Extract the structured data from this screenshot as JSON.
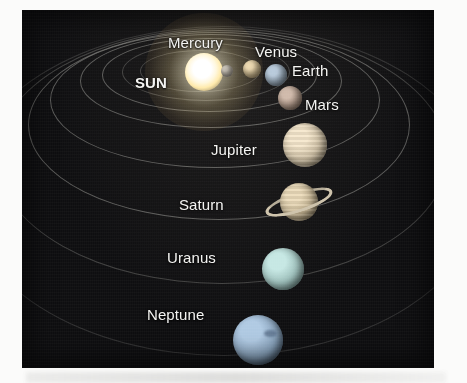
{
  "figure": {
    "type": "solar-system-diagram",
    "background_color": "#0e0e10",
    "label_color": "#f4f4f2",
    "orbit_color": "#c4c4bc",
    "panel": {
      "x": 22,
      "y": 10,
      "width": 412,
      "height": 358
    }
  },
  "star": {
    "name": "SUN",
    "label": "SUN",
    "color": "#fff7dd",
    "glow_color": "#ffe296",
    "cx": 182,
    "cy": 62,
    "radius": 19,
    "label_x": 113,
    "label_y": 64,
    "font_size": 15
  },
  "planets": [
    {
      "name": "Mercury",
      "label": "Mercury",
      "color": "#b9b2a6",
      "cx": 205,
      "cy": 61,
      "radius": 6,
      "label_x": 146,
      "label_y": 24,
      "font_size": 15,
      "order": 1
    },
    {
      "name": "Venus",
      "label": "Venus",
      "color": "#c9b489",
      "cx": 230,
      "cy": 59,
      "radius": 9,
      "label_x": 233,
      "label_y": 33,
      "font_size": 15,
      "order": 2
    },
    {
      "name": "Earth",
      "label": "Earth",
      "color": "#8fa2b4",
      "cx": 254,
      "cy": 65,
      "radius": 11,
      "label_x": 270,
      "label_y": 52,
      "font_size": 15,
      "order": 3
    },
    {
      "name": "Mars",
      "label": "Mars",
      "color": "#a89182",
      "cx": 268,
      "cy": 88,
      "radius": 12,
      "label_x": 283,
      "label_y": 86,
      "font_size": 15,
      "order": 4
    },
    {
      "name": "Jupiter",
      "label": "Jupiter",
      "color": "#cfc0a4",
      "cx": 283,
      "cy": 135,
      "radius": 22,
      "label_x": 189,
      "label_y": 131,
      "font_size": 15,
      "order": 5
    },
    {
      "name": "Saturn",
      "label": "Saturn",
      "color": "#c5b492",
      "ring_color": "#cfc4ac",
      "cx": 277,
      "cy": 192,
      "radius": 19,
      "ring_rx": 35,
      "ring_ry": 10,
      "ring_tilt_deg": -18,
      "label_x": 157,
      "label_y": 186,
      "font_size": 15,
      "order": 6
    },
    {
      "name": "Uranus",
      "label": "Uranus",
      "color": "#9fc1bd",
      "cx": 261,
      "cy": 259,
      "radius": 21,
      "label_x": 145,
      "label_y": 239,
      "font_size": 15,
      "order": 7
    },
    {
      "name": "Neptune",
      "label": "Neptune",
      "color": "#8aa4bd",
      "spot_color": "#5b718c",
      "cx": 236,
      "cy": 330,
      "radius": 25,
      "label_x": 125,
      "label_y": 296,
      "font_size": 15,
      "order": 8
    }
  ],
  "orbits": [
    {
      "name": "mercury-orbit",
      "left": 118,
      "top": 40,
      "width": 120,
      "height": 42,
      "opacity": "faint"
    },
    {
      "name": "venus-orbit",
      "left": 100,
      "top": 33,
      "width": 168,
      "height": 58,
      "opacity": "faint"
    },
    {
      "name": "earth-orbit",
      "left": 80,
      "top": 28,
      "width": 215,
      "height": 74,
      "opacity": "normal"
    },
    {
      "name": "mars-orbit",
      "left": 58,
      "top": 24,
      "width": 262,
      "height": 94,
      "opacity": "normal"
    },
    {
      "name": "jupiter-orbit",
      "left": 28,
      "top": 22,
      "width": 330,
      "height": 136,
      "opacity": "normal"
    },
    {
      "name": "saturn-orbit",
      "left": 6,
      "top": 20,
      "width": 382,
      "height": 190,
      "opacity": "normal"
    },
    {
      "name": "uranus-orbit",
      "left": -26,
      "top": 18,
      "width": 452,
      "height": 256,
      "opacity": "faint"
    },
    {
      "name": "neptune-orbit",
      "left": -58,
      "top": 16,
      "width": 520,
      "height": 330,
      "opacity": "faintest"
    }
  ]
}
